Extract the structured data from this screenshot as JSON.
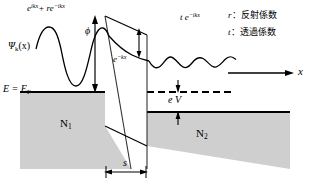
{
  "figure": {
    "type": "energy-band-tunneling-diagram",
    "colors": {
      "background": "#ffffff",
      "electrode_fill": "#cfcfcf",
      "line": "#000000",
      "text": "#000000"
    },
    "labels": {
      "incident_wave": "e",
      "incident_wave_sup1": "ikx",
      "incident_wave_mid": "+ r",
      "incident_wave_e2": "e",
      "incident_wave_sup2": "−ikx",
      "psi": "Ψ",
      "psi_sub": "k",
      "psi_arg": "(x)",
      "phi": "ϕ",
      "decay_wave": "e",
      "decay_wave_sup": "−kx",
      "transmitted_wave": "t e",
      "transmitted_wave_sup": "−ikx",
      "fermi_level": "E = E",
      "fermi_level_sub": "F",
      "electrode_left": "N",
      "electrode_left_sub": "1",
      "electrode_right": "N",
      "electrode_right_sub": "2",
      "bias": "e V",
      "barrier_width": "s",
      "axis_x": "x"
    },
    "legend": [
      {
        "symbol": "r",
        "separator": "：",
        "text": "反射係数"
      },
      {
        "symbol": "t",
        "separator": "：",
        "text": "透過係数"
      }
    ],
    "geometry": {
      "barrier_left_x": 105,
      "barrier_right_x": 147,
      "fermi_y": 92,
      "right_fermi_y": 112,
      "barrier_top_left_y": 16,
      "barrier_top_right_y": 35,
      "barrier_bottom_left_y": 126,
      "barrier_bottom_right_y": 146
    }
  }
}
